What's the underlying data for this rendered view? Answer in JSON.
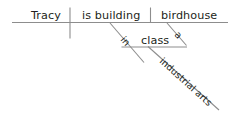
{
  "diagram": {
    "type": "reed-kellogg-sentence-diagram",
    "sentence": "Tracy is building a birdhouse in industrial arts class.",
    "baseline": {
      "subject": "Tracy",
      "verb": "is building",
      "direct_object": "birdhouse"
    },
    "modifiers": {
      "article": "a",
      "preposition": "in",
      "object_of_preposition": "class",
      "noun_modifier": "industrial arts"
    },
    "colors": {
      "line": "#8d8d8d",
      "text": "#231f20",
      "background": "#ffffff"
    }
  }
}
